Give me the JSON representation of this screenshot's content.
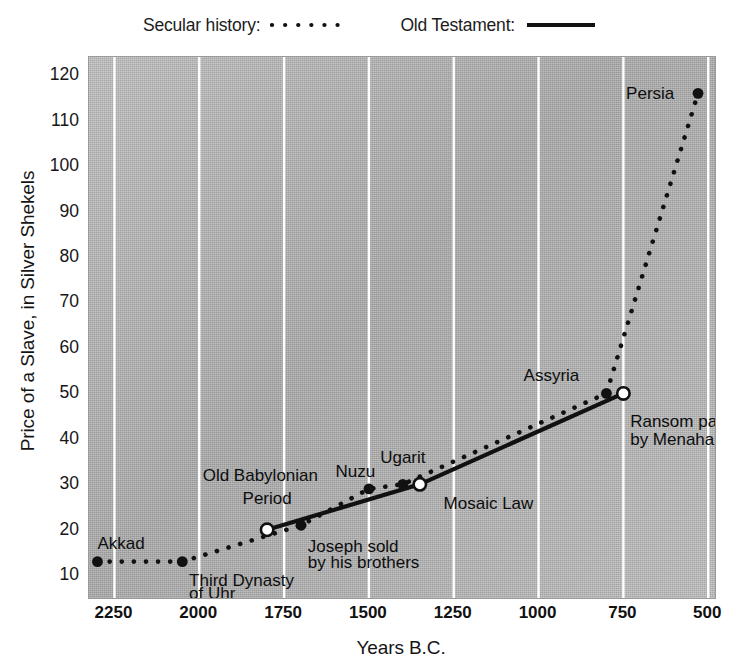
{
  "legend": {
    "items": [
      {
        "label": "Secular history:",
        "style": "dotted",
        "name": "legend-secular-history"
      },
      {
        "label": "Old Testament:",
        "style": "solid",
        "name": "legend-old-testament"
      }
    ]
  },
  "axes": {
    "y_title": "Price of a Slave, in Silver Shekels",
    "x_title": "Years B.C.",
    "y_ticks": [
      120,
      110,
      100,
      90,
      80,
      70,
      60,
      50,
      40,
      30,
      20,
      10
    ],
    "x_ticks": [
      2250,
      2000,
      1750,
      1500,
      1250,
      1000,
      750,
      500
    ]
  },
  "chart_data": {
    "type": "line",
    "title": "",
    "subtitle": "",
    "xlabel": "Years B.C.",
    "ylabel": "Price of a Slave, in Silver Shekels",
    "xlim": [
      2325,
      480
    ],
    "ylim": [
      5,
      124
    ],
    "x_inverted": true,
    "grid": "vertical-white",
    "legend_position": "top-center",
    "series": [
      {
        "name": "Secular history",
        "style": "dotted",
        "marker": "filled-circle",
        "points": [
          {
            "x": 2300,
            "y": 13,
            "label": "Akkad"
          },
          {
            "x": 2050,
            "y": 13,
            "label": "Third Dynasty of Uhr"
          },
          {
            "x": 1700,
            "y": 21,
            "label": "Old Babylonian Period"
          },
          {
            "x": 1500,
            "y": 29,
            "label": "Nuzu"
          },
          {
            "x": 1400,
            "y": 30,
            "label": "Ugarit"
          },
          {
            "x": 800,
            "y": 50,
            "label": "Assyria"
          },
          {
            "x": 530,
            "y": 116,
            "label": "Persia"
          }
        ]
      },
      {
        "name": "Old Testament",
        "style": "solid",
        "marker": "open-circle",
        "points": [
          {
            "x": 1800,
            "y": 20,
            "label": "Joseph sold by his brothers"
          },
          {
            "x": 1350,
            "y": 30,
            "label": "Mosaic Law"
          },
          {
            "x": 750,
            "y": 50,
            "label": "Ransom paid by Menahem"
          }
        ]
      }
    ],
    "annotations": [
      {
        "text": "Akkad",
        "x": 2300,
        "y": 17
      },
      {
        "text": "Third Dynasty",
        "x": 2030,
        "y": 9
      },
      {
        "text": "of Uhr",
        "x": 2030,
        "y": 6
      },
      {
        "text": "Old Babylonian",
        "x": 1820,
        "y": 32
      },
      {
        "text": "Period",
        "x": 1800,
        "y": 27
      },
      {
        "text": "Joseph sold",
        "x": 1680,
        "y": 16.5
      },
      {
        "text": "by his brothers",
        "x": 1680,
        "y": 13
      },
      {
        "text": "Nuzu",
        "x": 1540,
        "y": 33
      },
      {
        "text": "Ugarit",
        "x": 1400,
        "y": 36
      },
      {
        "text": "Mosaic Law",
        "x": 1280,
        "y": 26
      },
      {
        "text": "Assyria",
        "x": 880,
        "y": 54
      },
      {
        "text": "Ransom paid",
        "x": 730,
        "y": 44
      },
      {
        "text": "by Menaham",
        "x": 730,
        "y": 40
      },
      {
        "text": "Persia",
        "x": 600,
        "y": 116
      }
    ]
  },
  "annotation_labels": {
    "akkad": "Akkad",
    "third_dynasty_1": "Third Dynasty",
    "third_dynasty_2": "of Uhr",
    "old_babylonian_1": "Old Babylonian",
    "old_babylonian_2": "Period",
    "joseph_1": "Joseph sold",
    "joseph_2": "by his brothers",
    "nuzu": "Nuzu",
    "ugarit": "Ugarit",
    "mosaic_law": "Mosaic Law",
    "assyria": "Assyria",
    "ransom_1": "Ransom paid",
    "ransom_2": "by Menaham",
    "persia": "Persia"
  },
  "colors": {
    "plot_background": "#b0b0b0",
    "gridline": "#ffffff",
    "ink": "#111111",
    "page_background": "#ffffff"
  }
}
